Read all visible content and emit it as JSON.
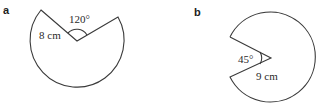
{
  "figures": [
    {
      "label": "a",
      "radius_text": "8 cm",
      "angle_text": "120°",
      "description": "Sector of a circle with a 120° wedge removed"
    },
    {
      "label": "b",
      "radius_text": "9 cm",
      "angle_text": "45°",
      "description": "Sector of a circle with a 45° wedge removed"
    }
  ],
  "colors": {
    "stroke": "#3a3a3a",
    "text": "#2a2a2a"
  }
}
